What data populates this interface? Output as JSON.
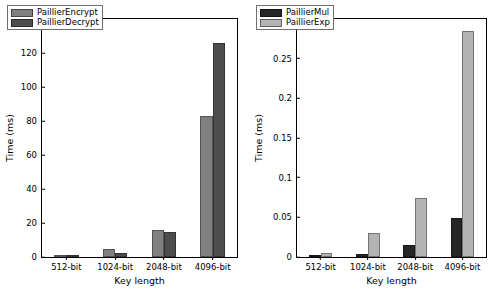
{
  "chart_data": [
    {
      "type": "bar",
      "panel": "left",
      "title": "",
      "xlabel": "Key length",
      "ylabel": "Time (ms)",
      "categories": [
        "512-bit",
        "1024-bit",
        "2048-bit",
        "4096-bit"
      ],
      "ylim": [
        0,
        140
      ],
      "yticks": [
        0,
        20,
        40,
        60,
        80,
        100,
        120,
        140
      ],
      "ytick_labels": [
        "0",
        "20",
        "40",
        "60",
        "80",
        "100",
        "120",
        "140"
      ],
      "grid": false,
      "legend_position": "upper left",
      "series": [
        {
          "name": "PaillierEncrypt",
          "color": "#808080",
          "values": [
            0.55,
            4.6,
            16.0,
            83.0
          ]
        },
        {
          "name": "PaillierDecrypt",
          "color": "#4d4d4d",
          "values": [
            0.4,
            2.6,
            15.0,
            126.0
          ]
        }
      ]
    },
    {
      "type": "bar",
      "panel": "right",
      "title": "",
      "xlabel": "Key length",
      "ylabel": "Time (ms)",
      "categories": [
        "512-bit",
        "1024-bit",
        "2048-bit",
        "4096-bit"
      ],
      "ylim": [
        0,
        0.3
      ],
      "yticks": [
        0,
        0.05,
        0.1,
        0.15,
        0.2,
        0.25,
        0.3
      ],
      "ytick_labels": [
        "0",
        "0.05",
        "0.1",
        "0.15",
        "0.2",
        "0.25",
        "0.3"
      ],
      "grid": false,
      "legend_position": "upper left",
      "series": [
        {
          "name": "PaillierMul",
          "color": "#262626",
          "values": [
            0.0012,
            0.0032,
            0.0148,
            0.0495
          ]
        },
        {
          "name": "PaillierExp",
          "color": "#b3b3b3",
          "values": [
            0.0048,
            0.0298,
            0.0738,
            0.2855
          ]
        }
      ]
    }
  ]
}
